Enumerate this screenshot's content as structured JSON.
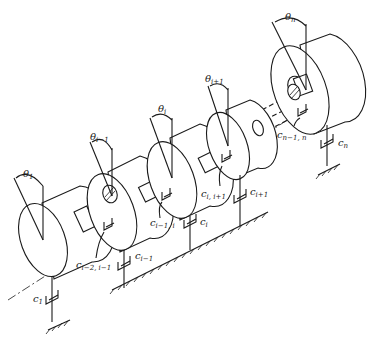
{
  "figure": {
    "colors": {
      "ink": "#1a1a1a",
      "background": "#ffffff"
    }
  },
  "disks": [
    {
      "id": "disk-1",
      "angle_label": "θ",
      "angle_sub": "1",
      "damper_label": "c",
      "damper_sub": "1"
    },
    {
      "id": "disk-i-minus-1",
      "angle_label": "θ",
      "angle_sub": "i−1",
      "damper_label": "c",
      "damper_sub": "i−1"
    },
    {
      "id": "disk-i",
      "angle_label": "θ",
      "angle_sub": "i",
      "damper_label": "c",
      "damper_sub": "i"
    },
    {
      "id": "disk-i-plus-1",
      "angle_label": "θ",
      "angle_sub": "i+1",
      "damper_label": "c",
      "damper_sub": "i+1"
    },
    {
      "id": "disk-n",
      "angle_label": "θ",
      "angle_sub": "n",
      "damper_label": "c",
      "damper_sub": "n"
    }
  ],
  "relative_dampers": [
    {
      "label": "c",
      "sub": "i−2, i−1"
    },
    {
      "label": "c",
      "sub": "i−1, i"
    },
    {
      "label": "c",
      "sub": "i, i+1"
    },
    {
      "label": "c",
      "sub": "n−1, n"
    }
  ]
}
